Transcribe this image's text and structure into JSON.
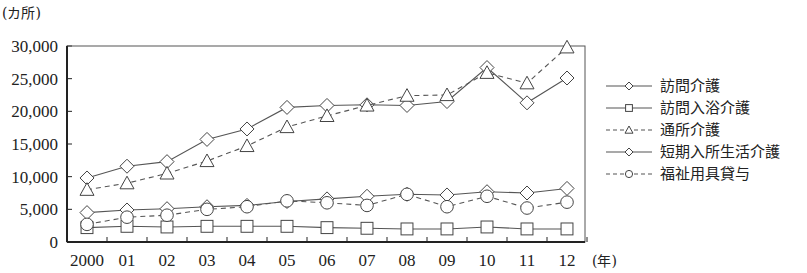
{
  "chart_data": {
    "type": "line",
    "title": "",
    "xlabel": "(年)",
    "ylabel": "(カ所)",
    "ylim": [
      0,
      30000
    ],
    "yticks": [
      0,
      5000,
      10000,
      15000,
      20000,
      25000,
      30000
    ],
    "ytick_labels": [
      "0",
      "5,000",
      "10,000",
      "15,000",
      "20,000",
      "25,000",
      "30,000"
    ],
    "categories": [
      "2000",
      "01",
      "02",
      "03",
      "04",
      "05",
      "06",
      "07",
      "08",
      "09",
      "10",
      "11",
      "12"
    ],
    "grid": false,
    "legend_position": "right",
    "series": [
      {
        "name": "訪問介護",
        "marker": "diamond",
        "dash": "solid",
        "values": [
          9800,
          11600,
          12300,
          15700,
          17300,
          20600,
          20900,
          21000,
          20900,
          21500,
          26700,
          21300,
          25100
        ]
      },
      {
        "name": "訪問入浴介護",
        "marker": "square",
        "dash": "solid",
        "values": [
          2200,
          2400,
          2300,
          2400,
          2400,
          2400,
          2200,
          2100,
          2000,
          2000,
          2300,
          2000,
          2000
        ]
      },
      {
        "name": "通所介護",
        "marker": "triangle",
        "dash": "dashed",
        "values": [
          8000,
          9000,
          10500,
          12400,
          14700,
          17600,
          19300,
          20900,
          22400,
          22500,
          25900,
          24300,
          29800
        ]
      },
      {
        "name": "短期入所生活介護",
        "marker": "diamond",
        "dash": "solid",
        "values": [
          4500,
          4900,
          5100,
          5400,
          5600,
          6200,
          6600,
          7000,
          7300,
          7200,
          7700,
          7500,
          8200
        ]
      },
      {
        "name": "福祉用具貸与",
        "marker": "circle",
        "dash": "dashed",
        "values": [
          2700,
          3800,
          4100,
          5000,
          5400,
          6300,
          6000,
          5600,
          7300,
          5400,
          7000,
          5200,
          6100
        ]
      }
    ]
  },
  "axis": {
    "y_unit": "(カ所)",
    "x_unit": "(年)"
  },
  "legend": [
    {
      "label": "訪問介護"
    },
    {
      "label": "訪問入浴介護"
    },
    {
      "label": "通所介護"
    },
    {
      "label": "短期入所生活介護"
    },
    {
      "label": "福祉用具貸与"
    }
  ],
  "colors": {
    "line": "#555555",
    "axis": "#222222",
    "marker_fill": "#ffffff"
  }
}
